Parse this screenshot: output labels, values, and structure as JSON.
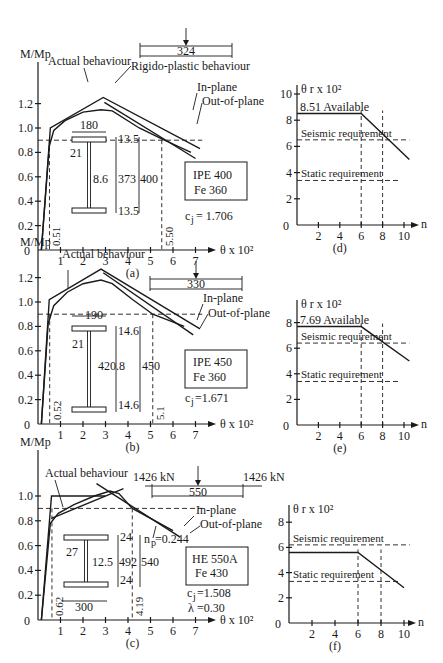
{
  "chart_data": [
    {
      "id": "a",
      "type": "line",
      "panel_label": "(a)",
      "title": "",
      "ylabel": "M/Mp",
      "xlabel": "θ x 10²",
      "xlim": [
        0,
        7
      ],
      "ylim": [
        0,
        1.2
      ],
      "x_ticks": [
        "1",
        "2",
        "3",
        "4",
        "5",
        "6",
        "7"
      ],
      "y_ticks": [
        "0.2",
        "0.4",
        "0.6",
        "0.8",
        "1.0",
        "1.2"
      ],
      "origin_label": "0",
      "threshold_y": 0.9,
      "markers_x": [
        {
          "value": 0.51,
          "label": "0.51"
        },
        {
          "value": 5.5,
          "label": "5.50"
        }
      ],
      "annotations": {
        "actual": "Actual behaviour",
        "rigid": "Rigido-plastic behaviour",
        "inplane": "In-plane",
        "outplane": "Out-of-plane"
      },
      "beam_span": "324",
      "section": {
        "name": "IPE 400",
        "steel": "Fe 360",
        "coef": "c",
        "coef_sub": "j",
        "coef_value": "= 1.706",
        "dims": {
          "flange_width": "180",
          "root_radius": "21",
          "web": "8.6",
          "web_depth": "373",
          "depth": "400",
          "flange_top": "13.5",
          "flange_bottom": "13.5"
        }
      },
      "series": [
        {
          "name": "Actual behaviour",
          "points": [
            [
              0.15,
              0
            ],
            [
              0.5,
              0.85
            ],
            [
              0.7,
              0.98
            ],
            [
              1.2,
              1.06
            ],
            [
              2.0,
              1.13
            ],
            [
              2.8,
              1.15
            ],
            [
              3.3,
              1.14
            ],
            [
              4.5,
              1.0
            ],
            [
              5.5,
              0.91
            ],
            [
              6.8,
              0.8
            ]
          ]
        },
        {
          "name": "Rigido-plastic (in-plane)",
          "points": [
            [
              0.15,
              0
            ],
            [
              0.55,
              1.0
            ],
            [
              2.9,
              1.25
            ],
            [
              7.2,
              0.83
            ]
          ]
        },
        {
          "name": "Rigido-plastic (out-of-plane)",
          "points": [
            [
              2.95,
              1.21
            ],
            [
              7.0,
              0.75
            ]
          ]
        }
      ]
    },
    {
      "id": "d",
      "type": "line",
      "panel_label": "(d)",
      "ylabel": "θ r x 10²",
      "xlabel": "n",
      "xlim": [
        0,
        10
      ],
      "ylim": [
        0,
        10
      ],
      "x_ticks": [
        "2",
        "4",
        "6",
        "8",
        "10"
      ],
      "y_ticks": [
        "2",
        "4",
        "6",
        "8",
        "10"
      ],
      "origin_label": "0",
      "available_label": "8.51 Available",
      "seismic_label": "Seismic requirement",
      "static_label": "Static requirement",
      "seismic_value": 6.5,
      "static_value": 3.4,
      "series": [
        {
          "name": "Available",
          "points": [
            [
              0,
              8.51
            ],
            [
              6,
              8.51
            ],
            [
              10.5,
              5.0
            ]
          ]
        }
      ],
      "markers_x": [
        6,
        8
      ]
    },
    {
      "id": "b",
      "type": "line",
      "panel_label": "(b)",
      "ylabel": "M/Mp",
      "xlabel": "θ x 10²",
      "xlim": [
        0,
        7
      ],
      "ylim": [
        0,
        1.2
      ],
      "x_ticks": [
        "1",
        "2",
        "3",
        "4",
        "5",
        "6",
        "7"
      ],
      "y_ticks": [
        "0.2",
        "0.4",
        "0.6",
        "0.8",
        "1.0",
        "1.2"
      ],
      "origin_label": "0",
      "threshold_y": 0.9,
      "markers_x": [
        {
          "value": 0.52,
          "label": "0.52"
        },
        {
          "value": 5.1,
          "label": "5.1"
        }
      ],
      "annotations": {
        "actual": "Actual behaviour",
        "inplane": "In-plane",
        "outplane": "Out-of-plane"
      },
      "beam_span": "330",
      "section": {
        "name": "IPE 450",
        "steel": "Fe 360",
        "coef": "c",
        "coef_sub": "j",
        "coef_value": "=1.671",
        "dims": {
          "flange_width": "190",
          "root_radius": "21",
          "web_depth": "420.8",
          "depth": "450",
          "flange_top": "14.6",
          "flange_bottom": "14.6"
        }
      },
      "series": [
        {
          "name": "Actual behaviour",
          "points": [
            [
              0.15,
              0
            ],
            [
              0.45,
              0.82
            ],
            [
              0.7,
              0.97
            ],
            [
              1.3,
              1.08
            ],
            [
              2.0,
              1.15
            ],
            [
              2.8,
              1.18
            ],
            [
              3.3,
              1.15
            ],
            [
              4.2,
              1.02
            ],
            [
              5.1,
              0.9
            ],
            [
              6.5,
              0.8
            ]
          ]
        },
        {
          "name": "Rigido-plastic (in-plane)",
          "points": [
            [
              0.15,
              0
            ],
            [
              0.5,
              1.02
            ],
            [
              2.8,
              1.27
            ],
            [
              7.2,
              0.78
            ]
          ]
        },
        {
          "name": "Rigido-plastic (out-of-plane)",
          "points": [
            [
              2.9,
              1.24
            ],
            [
              6.9,
              0.73
            ]
          ]
        }
      ]
    },
    {
      "id": "e",
      "type": "line",
      "panel_label": "(e)",
      "ylabel": "θ r x 10²",
      "xlabel": "n",
      "xlim": [
        0,
        10
      ],
      "ylim": [
        0,
        8
      ],
      "x_ticks": [
        "2",
        "4",
        "6",
        "8",
        "10"
      ],
      "y_ticks": [
        "2",
        "4",
        "6",
        "8"
      ],
      "origin_label": "0",
      "available_label": "7.69 Available",
      "seismic_label": "Seismic requirement",
      "static_label": "Static requirement",
      "seismic_value": 6.4,
      "static_value": 3.4,
      "series": [
        {
          "name": "Available",
          "points": [
            [
              0,
              7.69
            ],
            [
              6,
              7.69
            ],
            [
              10.5,
              5.0
            ]
          ]
        }
      ],
      "markers_x": [
        6,
        8
      ]
    },
    {
      "id": "c",
      "type": "line",
      "panel_label": "(c)",
      "ylabel": "M/Mp",
      "xlabel": "θ x 10²",
      "xlim": [
        0,
        7
      ],
      "ylim": [
        0,
        1.0
      ],
      "x_ticks": [
        "1",
        "2",
        "3",
        "4",
        "5",
        "6",
        "7"
      ],
      "y_ticks": [
        "0.2",
        "0.4",
        "0.6",
        "0.8",
        "1.0"
      ],
      "origin_label": "0",
      "threshold_y": 0.9,
      "markers_x": [
        {
          "value": 0.62,
          "label": "0.62"
        },
        {
          "value": 4.19,
          "label": "4.19"
        }
      ],
      "annotations": {
        "actual": "Actual behaviour",
        "inplane": "In-plane",
        "outplane": "Out-of-plane",
        "np": "n",
        "np_sub": "p",
        "np_value": "=0.244"
      },
      "beam_span": "550",
      "beam_load_left": "1426 kN",
      "beam_load_right": "1426 kN",
      "section": {
        "name": "HE 550A",
        "steel": "Fe 430",
        "coef": "c",
        "coef_sub": "j",
        "coef_value": "=1.508",
        "lambda": "λ",
        "lambda_value": "=0.30",
        "dims": {
          "flange_width": "300",
          "root_radius": "27",
          "web": "12.5",
          "web_depth": "492",
          "depth": "540",
          "flange_top": "24",
          "flange_bottom": "24"
        }
      },
      "series": [
        {
          "name": "Actual behaviour",
          "points": [
            [
              0.15,
              0
            ],
            [
              0.55,
              0.78
            ],
            [
              0.9,
              0.86
            ],
            [
              1.6,
              0.93
            ],
            [
              2.5,
              1.0
            ],
            [
              3.2,
              1.04
            ],
            [
              3.6,
              1.02
            ],
            [
              4.19,
              0.9
            ],
            [
              5.0,
              0.82
            ],
            [
              6.0,
              0.72
            ]
          ]
        },
        {
          "name": "Rigido-plastic (in-plane)",
          "points": [
            [
              0.15,
              0
            ],
            [
              0.6,
              1.0
            ],
            [
              3.0,
              1.0
            ]
          ]
        },
        {
          "name": "Rigido-plastic (rising)",
          "points": [
            [
              0.6,
              0.82
            ],
            [
              3.8,
              1.06
            ]
          ]
        },
        {
          "name": "Rigido-plastic (out-of-plane)",
          "points": [
            [
              2.6,
              1.1
            ],
            [
              6.3,
              0.67
            ]
          ]
        }
      ]
    },
    {
      "id": "f",
      "type": "line",
      "panel_label": "(f)",
      "ylabel": "θ r x 10²",
      "xlabel": "n",
      "xlim": [
        0,
        10
      ],
      "ylim": [
        0,
        8
      ],
      "x_ticks": [
        "2",
        "4",
        "6",
        "8",
        "10"
      ],
      "y_ticks": [
        "2",
        "4",
        "6",
        "8"
      ],
      "origin_label": "0",
      "seismic_label": "Seismic requirement",
      "static_label": "Static requirement",
      "seismic_value": 6.2,
      "static_value": 3.3,
      "series": [
        {
          "name": "Available",
          "points": [
            [
              0,
              5.6
            ],
            [
              6,
              5.6
            ],
            [
              10,
              2.8
            ]
          ]
        }
      ],
      "markers_x": [
        6,
        8
      ]
    }
  ]
}
